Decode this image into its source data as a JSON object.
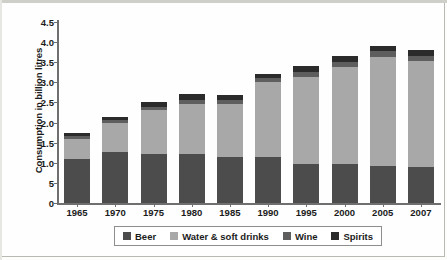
{
  "chart_data": {
    "type": "bar",
    "subtype": "stacked-bar",
    "title": "",
    "xlabel": "",
    "ylabel": "Consumption in billion litres",
    "ylim": [
      0,
      4.5
    ],
    "ytick_values": [
      4.5,
      4.0,
      3.5,
      3.0,
      2.5,
      2.0,
      1.5,
      1.0,
      0.5,
      0
    ],
    "ytick_labels": [
      "4.5",
      "4.0",
      "3.5",
      "3.0",
      "2.5",
      "2.0",
      "1.5",
      "1.0",
      "5",
      "0"
    ],
    "grid": false,
    "legend_position": "bottom",
    "categories": [
      "1965",
      "1970",
      "1975",
      "1980",
      "1985",
      "1990",
      "1995",
      "2000",
      "2005",
      "2007"
    ],
    "series": [
      {
        "name": "Beer",
        "color": "#4c4c4c",
        "values": [
          1.1,
          1.27,
          1.22,
          1.22,
          1.15,
          1.15,
          0.98,
          0.97,
          0.92,
          0.9
        ]
      },
      {
        "name": "Water & soft drinks",
        "color": "#a8a8a8",
        "values": [
          0.48,
          0.71,
          1.1,
          1.25,
          1.3,
          1.85,
          2.15,
          2.4,
          2.72,
          2.62
        ]
      },
      {
        "name": "Wine",
        "color": "#5e5e5e",
        "values": [
          0.09,
          0.09,
          0.08,
          0.1,
          0.1,
          0.1,
          0.13,
          0.14,
          0.13,
          0.14
        ]
      },
      {
        "name": "Spirits",
        "color": "#2b2b2b",
        "values": [
          0.08,
          0.08,
          0.1,
          0.13,
          0.13,
          0.1,
          0.14,
          0.14,
          0.13,
          0.14
        ]
      }
    ],
    "totals": [
      1.75,
      2.15,
      2.5,
      2.7,
      2.68,
      3.2,
      3.4,
      3.65,
      3.9,
      3.8
    ]
  },
  "axes": {
    "y_title": "Consumption in billion litres"
  },
  "legend": {
    "items": [
      {
        "label": "Beer",
        "color": "#4c4c4c"
      },
      {
        "label": "Water & soft drinks",
        "color": "#a8a8a8"
      },
      {
        "label": "Wine",
        "color": "#5e5e5e"
      },
      {
        "label": "Spirits",
        "color": "#2b2b2b"
      }
    ]
  }
}
